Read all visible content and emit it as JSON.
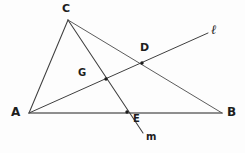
{
  "figure": {
    "type": "euclidean-geometry-diagram",
    "width": 245,
    "height": 153,
    "background_color": "#fdfdfd",
    "stroke_color": "#3a3a3a",
    "base_stroke_color": "#808080",
    "dot_color": "#1d1d1d"
  },
  "points": {
    "A": {
      "label": "A",
      "x": 29,
      "y": 113,
      "dot": false
    },
    "B": {
      "label": "B",
      "x": 222,
      "y": 113,
      "dot": false
    },
    "C": {
      "label": "C",
      "x": 68,
      "y": 20,
      "dot": false
    },
    "D": {
      "label": "D",
      "x": 142,
      "y": 63,
      "dot": true
    },
    "E": {
      "label": "E",
      "x": 127,
      "y": 112,
      "dot": true
    },
    "G": {
      "label": "G",
      "x": 106,
      "y": 79,
      "dot": true
    }
  },
  "line_labels": {
    "l": {
      "label": "ℓ",
      "x": 211,
      "y": 23
    },
    "m": {
      "label": "m",
      "x": 146,
      "y": 132
    }
  },
  "segments": [
    {
      "name": "segment-AC",
      "from": "A",
      "to": "C"
    },
    {
      "name": "segment-AB",
      "from": "A",
      "to": "B"
    },
    {
      "name": "segment-CB",
      "from": "C",
      "to": "B"
    },
    {
      "name": "ray-l-A-through-D",
      "from": "A",
      "to": "l-end"
    },
    {
      "name": "ray-m-C-through-E",
      "from": "C",
      "to": "m-end"
    }
  ],
  "endpoints": {
    "l_end": {
      "x": 208,
      "y": 33
    },
    "m_end": {
      "x": 143,
      "y": 133
    }
  },
  "incidences": [
    "D lies on segment CB and on line l",
    "G lies on line l and on line m",
    "E lies on segment AB and on line m",
    "line l passes through A, G, D",
    "line m passes through C, G, E"
  ]
}
